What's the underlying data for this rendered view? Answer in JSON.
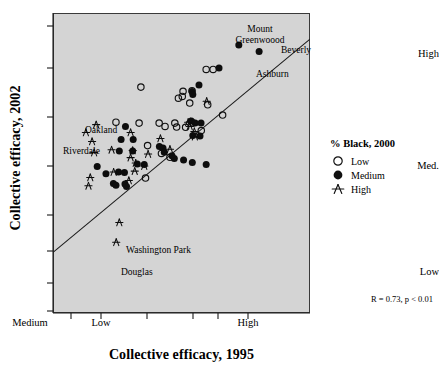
{
  "chart_data": {
    "type": "scatter",
    "title": "",
    "xlabel": "Collective efficacy, 1995",
    "ylabel": "Collective efficacy, 2002",
    "xtick_labels": [
      "Low",
      "Medium",
      "High"
    ],
    "ytick_labels": [
      "High",
      "Med.",
      "Low"
    ],
    "xlim": [
      0,
      10
    ],
    "ylim": [
      0,
      10
    ],
    "grid": false,
    "annotation": "R = 0.73, p < 0.01",
    "regression_line": {
      "x0": 0.0,
      "y0": 2.02,
      "x1": 10.0,
      "y1": 9.13
    },
    "legend": {
      "title": "% Black, 2000",
      "position": "right",
      "entries": [
        {
          "label": "Low",
          "marker": "open-circle"
        },
        {
          "label": "Medium",
          "marker": "filled-circle"
        },
        {
          "label": "High",
          "marker": "star"
        }
      ]
    },
    "series": [
      {
        "name": "Low",
        "marker": "open-circle",
        "points": [
          {
            "x": 5.96,
            "y": 8.12
          },
          {
            "x": 6.23,
            "y": 8.12
          },
          {
            "x": 3.42,
            "y": 7.53
          },
          {
            "x": 4.88,
            "y": 7.16
          },
          {
            "x": 5.06,
            "y": 7.39
          },
          {
            "x": 5.03,
            "y": 7.22
          },
          {
            "x": 5.41,
            "y": 7.41
          },
          {
            "x": 6.02,
            "y": 6.94
          },
          {
            "x": 5.32,
            "y": 7.0
          },
          {
            "x": 6.6,
            "y": 6.6
          },
          {
            "x": 2.45,
            "y": 6.36
          },
          {
            "x": 3.35,
            "y": 6.33
          },
          {
            "x": 4.13,
            "y": 6.33
          },
          {
            "x": 4.36,
            "y": 6.22
          },
          {
            "x": 4.74,
            "y": 6.33
          },
          {
            "x": 4.81,
            "y": 6.2
          },
          {
            "x": 5.16,
            "y": 6.19
          },
          {
            "x": 5.44,
            "y": 6.33
          },
          {
            "x": 5.77,
            "y": 6.08
          },
          {
            "x": 3.68,
            "y": 5.58
          },
          {
            "x": 4.22,
            "y": 5.32
          },
          {
            "x": 4.55,
            "y": 5.19
          },
          {
            "x": 3.6,
            "y": 4.5
          }
        ]
      },
      {
        "name": "Medium",
        "marker": "filled-circle",
        "points": [
          {
            "x": 7.23,
            "y": 8.93
          },
          {
            "x": 8.02,
            "y": 8.72
          },
          {
            "x": 6.46,
            "y": 8.17
          },
          {
            "x": 5.68,
            "y": 7.6
          },
          {
            "x": 5.41,
            "y": 7.38
          },
          {
            "x": 5.44,
            "y": 7.28
          },
          {
            "x": 5.38,
            "y": 6.4
          },
          {
            "x": 5.53,
            "y": 6.33
          },
          {
            "x": 5.76,
            "y": 6.33
          },
          {
            "x": 5.44,
            "y": 5.92
          },
          {
            "x": 5.72,
            "y": 5.9
          },
          {
            "x": 2.82,
            "y": 6.22
          },
          {
            "x": 2.65,
            "y": 5.78
          },
          {
            "x": 3.12,
            "y": 5.78
          },
          {
            "x": 2.58,
            "y": 5.4
          },
          {
            "x": 3.1,
            "y": 5.4
          },
          {
            "x": 4.14,
            "y": 5.55
          },
          {
            "x": 4.28,
            "y": 5.5
          },
          {
            "x": 4.33,
            "y": 5.36
          },
          {
            "x": 4.63,
            "y": 5.24
          },
          {
            "x": 4.72,
            "y": 5.15
          },
          {
            "x": 5.08,
            "y": 5.1
          },
          {
            "x": 5.42,
            "y": 5.02
          },
          {
            "x": 5.96,
            "y": 4.95
          },
          {
            "x": 1.72,
            "y": 4.88
          },
          {
            "x": 2.06,
            "y": 4.64
          },
          {
            "x": 2.55,
            "y": 4.7
          },
          {
            "x": 2.78,
            "y": 4.68
          },
          {
            "x": 2.35,
            "y": 4.32
          },
          {
            "x": 2.45,
            "y": 4.26
          },
          {
            "x": 2.8,
            "y": 4.3
          },
          {
            "x": 2.86,
            "y": 4.22
          },
          {
            "x": 3.28,
            "y": 4.97
          },
          {
            "x": 3.55,
            "y": 4.95
          }
        ]
      },
      {
        "name": "High",
        "marker": "star",
        "points": [
          {
            "x": 5.98,
            "y": 7.06
          },
          {
            "x": 5.26,
            "y": 6.36
          },
          {
            "x": 5.35,
            "y": 6.38
          },
          {
            "x": 5.32,
            "y": 6.22
          },
          {
            "x": 5.5,
            "y": 6.05
          },
          {
            "x": 1.68,
            "y": 6.28
          },
          {
            "x": 1.28,
            "y": 6.02
          },
          {
            "x": 1.52,
            "y": 5.72
          },
          {
            "x": 1.6,
            "y": 5.35
          },
          {
            "x": 3.02,
            "y": 6.02
          },
          {
            "x": 2.28,
            "y": 5.44
          },
          {
            "x": 3.1,
            "y": 5.42
          },
          {
            "x": 3.02,
            "y": 5.18
          },
          {
            "x": 3.22,
            "y": 5.0
          },
          {
            "x": 3.7,
            "y": 5.3
          },
          {
            "x": 4.55,
            "y": 5.46
          },
          {
            "x": 3.55,
            "y": 4.9
          },
          {
            "x": 3.18,
            "y": 4.73
          },
          {
            "x": 2.36,
            "y": 4.7
          },
          {
            "x": 2.95,
            "y": 4.42
          },
          {
            "x": 1.45,
            "y": 4.52
          },
          {
            "x": 1.38,
            "y": 4.24
          },
          {
            "x": 2.58,
            "y": 3.02
          },
          {
            "x": 2.46,
            "y": 2.36
          },
          {
            "x": 5.52,
            "y": 5.88
          },
          {
            "x": 4.18,
            "y": 5.82
          }
        ]
      }
    ],
    "annotated_points": [
      {
        "label": "Mount\nGreenwoood",
        "x": 7.23,
        "y": 8.93
      },
      {
        "label": "Beverly",
        "x": 8.02,
        "y": 8.72
      },
      {
        "label": "Ashburn",
        "x": 6.88,
        "y": 8.35
      },
      {
        "label": "Oakland",
        "x": 1.68,
        "y": 6.28
      },
      {
        "label": "Riverdale",
        "x": 1.28,
        "y": 6.02
      },
      {
        "label": "Washington Park",
        "x": 2.58,
        "y": 3.02
      },
      {
        "label": "Douglas",
        "x": 2.46,
        "y": 2.36
      }
    ]
  },
  "axes": {
    "y_title": "Collective efficacy, 2002",
    "x_title": "Collective efficacy, 1995",
    "y_labels": [
      "High",
      "Med.",
      "Low"
    ],
    "x_labels": [
      "Low",
      "Medium",
      "High"
    ]
  },
  "legend": {
    "title": "% Black, 2000",
    "low": "Low",
    "medium": "Medium",
    "high": "High"
  },
  "annotation": {
    "stat": "R = 0.73, p < 0.01"
  },
  "labels": {
    "mount": "Mount",
    "greenwood": "Greenwoood",
    "beverly": "Beverly",
    "ashburn": "Ashburn",
    "oakland": "Oakland",
    "riverdale": "Riverdale",
    "washington_park": "Washington Park",
    "douglas": "Douglas"
  }
}
